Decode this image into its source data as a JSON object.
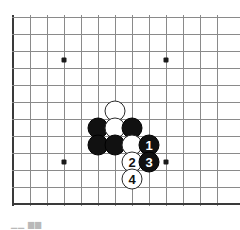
{
  "diagram": {
    "board": {
      "grid_spacing_px": 17,
      "origin_x_px": 13,
      "origin_y_px": 17,
      "columns": 13,
      "rows": 12,
      "line_color": "#8a8a8a",
      "edge_color": "#3a3a3a",
      "background_color": "#ffffff",
      "edges_drawn": [
        "left",
        "bottom"
      ],
      "star_points": [
        {
          "col": 3,
          "row": 2.5
        },
        {
          "col": 9,
          "row": 2.5
        },
        {
          "col": 3,
          "row": 8.5
        },
        {
          "col": 9,
          "row": 8.5
        }
      ]
    },
    "stones": [
      {
        "col": 6,
        "row": 5.5,
        "color": "white",
        "label": ""
      },
      {
        "col": 5,
        "row": 6.5,
        "color": "black",
        "label": ""
      },
      {
        "col": 6,
        "row": 6.5,
        "color": "white",
        "label": ""
      },
      {
        "col": 7,
        "row": 6.5,
        "color": "black",
        "label": ""
      },
      {
        "col": 5,
        "row": 7.5,
        "color": "black",
        "label": ""
      },
      {
        "col": 6,
        "row": 7.5,
        "color": "black",
        "label": ""
      },
      {
        "col": 7,
        "row": 7.5,
        "color": "white",
        "label": ""
      },
      {
        "col": 8,
        "row": 7.5,
        "color": "black",
        "label": "1"
      },
      {
        "col": 7,
        "row": 8.5,
        "color": "white",
        "label": "2"
      },
      {
        "col": 8,
        "row": 8.5,
        "color": "black",
        "label": "3"
      },
      {
        "col": 7,
        "row": 9.5,
        "color": "white",
        "label": "4"
      }
    ],
    "caption_fragment": "▁▁ ▆▆"
  }
}
